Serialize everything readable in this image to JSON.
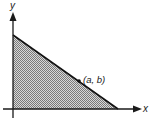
{
  "diagram": {
    "x_axis_label": "x",
    "y_axis_label": "y",
    "point_label": "(a, b)",
    "colors": {
      "axis": "#1a1a1a",
      "line": "#111111",
      "fill_dot": "#8a8a8a",
      "fill_bg": "#d6d6d6"
    },
    "region": {
      "description": "shaded triangular region bounded by the axes and a line",
      "vertices": [
        [
          0,
          "y-intercept"
        ],
        [
          "origin"
        ],
        [
          "x-intercept",
          0
        ]
      ]
    }
  }
}
